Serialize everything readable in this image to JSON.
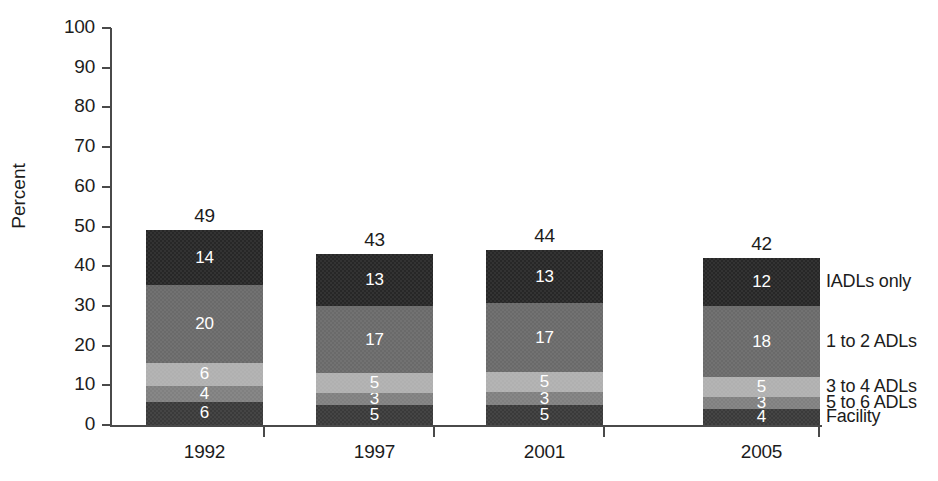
{
  "chart_data": {
    "type": "bar",
    "subtype": "stacked-bar",
    "title": "",
    "xlabel": "",
    "ylabel": "Percent",
    "ylim": [
      0,
      100
    ],
    "yticks": [
      0,
      10,
      20,
      30,
      40,
      50,
      60,
      70,
      80,
      90,
      100
    ],
    "ytick_labels": [
      "0",
      "10",
      "20",
      "30",
      "40",
      "50",
      "60",
      "70",
      "80",
      "90",
      "100"
    ],
    "categories": [
      "1992",
      "1997",
      "2001",
      "2005"
    ],
    "totals": [
      49,
      43,
      44,
      42
    ],
    "grid": false,
    "legend_position": "right-inline",
    "series": [
      {
        "name": "Facility",
        "color": "#3a3a3a",
        "values": [
          6,
          5,
          5,
          4
        ]
      },
      {
        "name": "5 to 6 ADLs",
        "color": "#808080",
        "values": [
          4,
          3,
          3,
          3
        ]
      },
      {
        "name": "3 to 4 ADLs",
        "color": "#b0b0b0",
        "values": [
          6,
          5,
          5,
          5
        ]
      },
      {
        "name": "1 to 2 ADLs",
        "color": "#6a6a6a",
        "values": [
          20,
          17,
          17,
          18
        ]
      },
      {
        "name": "IADLs only",
        "color": "#272727",
        "values": [
          14,
          13,
          13,
          12
        ]
      }
    ],
    "stack_order_bottom_to_top": [
      "Facility",
      "5 to 6 ADLs",
      "3 to 4 ADLs",
      "1 to 2 ADLs",
      "IADLs only"
    ]
  },
  "axis": {
    "y_title": "Percent",
    "y_labels": [
      "100",
      "90",
      "80",
      "70",
      "60",
      "50",
      "40",
      "30",
      "20",
      "10",
      "0"
    ],
    "x_labels": [
      "1992",
      "1997",
      "2001",
      "2005"
    ]
  },
  "bars": [
    {
      "category": "1992",
      "total": "49",
      "segments": [
        {
          "label": "IADLs only",
          "value": "14",
          "color": "#272727"
        },
        {
          "label": "1 to 2 ADLs",
          "value": "20",
          "color": "#6a6a6a"
        },
        {
          "label": "3 to 4 ADLs",
          "value": "6",
          "color": "#b0b0b0"
        },
        {
          "label": "5 to 6 ADLs",
          "value": "4",
          "color": "#808080"
        },
        {
          "label": "Facility",
          "value": "6",
          "color": "#3a3a3a"
        }
      ]
    },
    {
      "category": "1997",
      "total": "43",
      "segments": [
        {
          "label": "IADLs only",
          "value": "13",
          "color": "#272727"
        },
        {
          "label": "1 to 2 ADLs",
          "value": "17",
          "color": "#6a6a6a"
        },
        {
          "label": "3 to 4 ADLs",
          "value": "5",
          "color": "#b0b0b0"
        },
        {
          "label": "5 to 6 ADLs",
          "value": "3",
          "color": "#808080"
        },
        {
          "label": "Facility",
          "value": "5",
          "color": "#3a3a3a"
        }
      ]
    },
    {
      "category": "2001",
      "total": "44",
      "segments": [
        {
          "label": "IADLs only",
          "value": "13",
          "color": "#272727"
        },
        {
          "label": "1 to 2 ADLs",
          "value": "17",
          "color": "#6a6a6a"
        },
        {
          "label": "3 to 4 ADLs",
          "value": "5",
          "color": "#b0b0b0"
        },
        {
          "label": "5 to 6 ADLs",
          "value": "3",
          "color": "#808080"
        },
        {
          "label": "Facility",
          "value": "5",
          "color": "#3a3a3a"
        }
      ]
    },
    {
      "category": "2005",
      "total": "42",
      "segments": [
        {
          "label": "IADLs only",
          "value": "12",
          "color": "#272727"
        },
        {
          "label": "1 to 2 ADLs",
          "value": "18",
          "color": "#6a6a6a"
        },
        {
          "label": "3 to 4 ADLs",
          "value": "5",
          "color": "#b0b0b0"
        },
        {
          "label": "5 to 6 ADLs",
          "value": "3",
          "color": "#808080"
        },
        {
          "label": "Facility",
          "value": "4",
          "color": "#3a3a3a"
        }
      ]
    }
  ],
  "legend": {
    "items": [
      {
        "label": "IADLs only"
      },
      {
        "label": "1 to 2 ADLs"
      },
      {
        "label": "3 to 4 ADLs"
      },
      {
        "label": "5 to 6 ADLs"
      },
      {
        "label": "Facility"
      }
    ]
  }
}
